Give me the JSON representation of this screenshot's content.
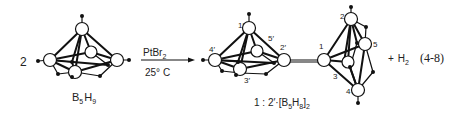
{
  "reaction": {
    "coefficient": "2",
    "reactant_label": {
      "main": "B",
      "sub1": "5",
      "mid": "H",
      "sub2": "9"
    },
    "reagent": {
      "main": "PtBr",
      "sub": "2"
    },
    "condition": "25° C",
    "product_label": {
      "pre": "1 : 2′·[B",
      "sub1": "5",
      "mid": "H",
      "sub2": "8",
      "post": "]",
      "sub3": "2"
    },
    "byproduct": {
      "plus": "+",
      "main": "H",
      "sub": "2"
    },
    "equation_number": "(4-8)",
    "atom_labels_left_cage": [
      "1′",
      "2′",
      "3′",
      "4′",
      "5′"
    ],
    "atom_labels_right_cage": [
      "1",
      "2",
      "3",
      "4",
      "5"
    ]
  }
}
